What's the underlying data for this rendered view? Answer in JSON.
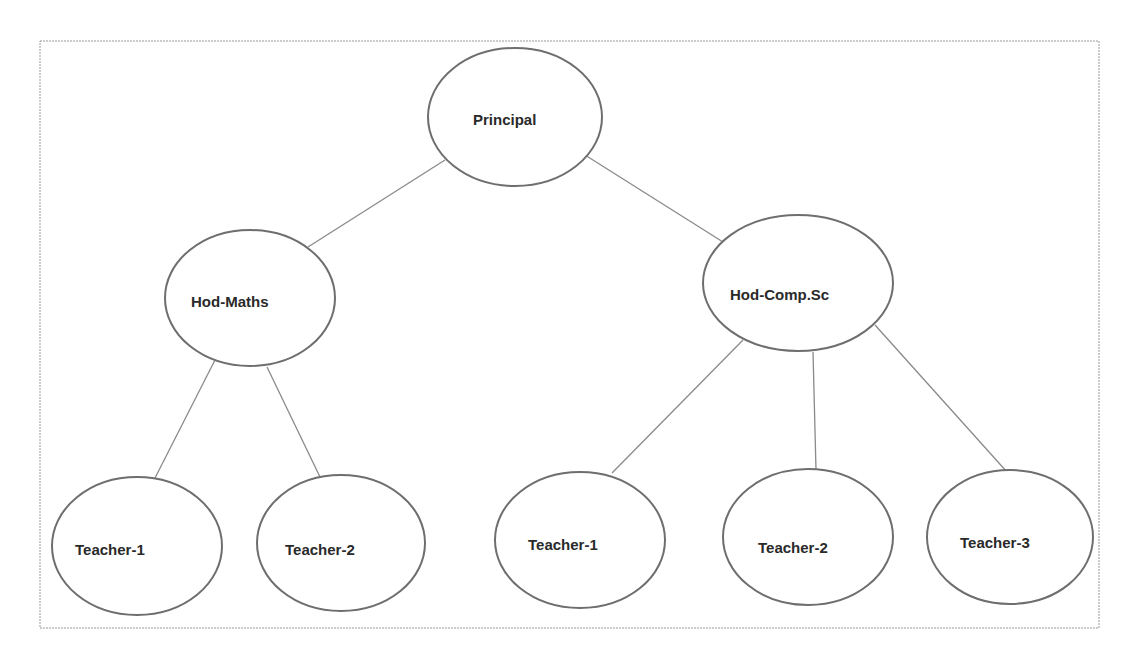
{
  "diagram": {
    "type": "hierarchy-tree",
    "colors": {
      "frame": "#9a9a9a",
      "node_stroke": "#6e6e6e",
      "edge": "#8a8a8a",
      "text": "#2a2a2a",
      "background": "#ffffff"
    },
    "nodes": [
      {
        "id": "principal",
        "label": "Principal",
        "cx": 515,
        "cy": 117,
        "rx": 87,
        "ry": 69,
        "tx": 473,
        "ty": 125
      },
      {
        "id": "hod-maths",
        "label": "Hod-Maths",
        "cx": 250,
        "cy": 298,
        "rx": 85,
        "ry": 68,
        "tx": 191,
        "ty": 307
      },
      {
        "id": "hod-compsc",
        "label": "Hod-Comp.Sc",
        "cx": 798,
        "cy": 283,
        "rx": 95,
        "ry": 68,
        "tx": 730,
        "ty": 300
      },
      {
        "id": "maths-teacher-1",
        "label": "Teacher-1",
        "cx": 137,
        "cy": 546,
        "rx": 85,
        "ry": 69,
        "tx": 75,
        "ty": 555
      },
      {
        "id": "maths-teacher-2",
        "label": "Teacher-2",
        "cx": 341,
        "cy": 543,
        "rx": 84,
        "ry": 68,
        "tx": 285,
        "ty": 555
      },
      {
        "id": "compsc-teacher-1",
        "label": "Teacher-1",
        "cx": 580,
        "cy": 540,
        "rx": 85,
        "ry": 68,
        "tx": 528,
        "ty": 550
      },
      {
        "id": "compsc-teacher-2",
        "label": "Teacher-2",
        "cx": 808,
        "cy": 537,
        "rx": 85,
        "ry": 68,
        "tx": 758,
        "ty": 553
      },
      {
        "id": "compsc-teacher-3",
        "label": "Teacher-3",
        "cx": 1010,
        "cy": 537,
        "rx": 83,
        "ry": 67,
        "tx": 960,
        "ty": 548
      }
    ],
    "edges": [
      {
        "from": "principal",
        "to": "hod-maths",
        "x1": 445,
        "y1": 160,
        "x2": 308,
        "y2": 247
      },
      {
        "from": "principal",
        "to": "hod-compsc",
        "x1": 585,
        "y1": 155,
        "x2": 723,
        "y2": 242
      },
      {
        "from": "hod-maths",
        "to": "maths-teacher-1",
        "x1": 215,
        "y1": 360,
        "x2": 155,
        "y2": 478
      },
      {
        "from": "hod-maths",
        "to": "maths-teacher-2",
        "x1": 267,
        "y1": 367,
        "x2": 320,
        "y2": 477
      },
      {
        "from": "hod-compsc",
        "to": "compsc-teacher-1",
        "x1": 743,
        "y1": 340,
        "x2": 612,
        "y2": 473
      },
      {
        "from": "hod-compsc",
        "to": "compsc-teacher-2",
        "x1": 813,
        "y1": 352,
        "x2": 816,
        "y2": 470
      },
      {
        "from": "hod-compsc",
        "to": "compsc-teacher-3",
        "x1": 875,
        "y1": 325,
        "x2": 1007,
        "y2": 472
      }
    ]
  }
}
